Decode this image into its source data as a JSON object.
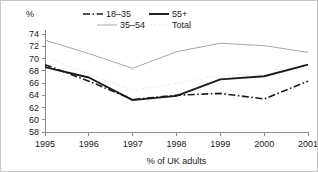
{
  "chart_data": {
    "type": "line",
    "title": "",
    "xlabel": "% of UK adults",
    "ylabel": "%",
    "yunit_label": "%",
    "categories": [
      "1995",
      "1996",
      "1997",
      "1998",
      "1999",
      "2000",
      "2001"
    ],
    "x": [
      1995,
      1996,
      1997,
      1998,
      1999,
      2000,
      2001
    ],
    "ylim": [
      58,
      74
    ],
    "xlim": [
      1995,
      2001
    ],
    "ytick_labels": [
      "58",
      "60",
      "62",
      "64",
      "66",
      "68",
      "70",
      "72",
      "74"
    ],
    "yticks": [
      58,
      60,
      62,
      64,
      66,
      68,
      70,
      72,
      74
    ],
    "grid": false,
    "legend_position": "top-center",
    "series": [
      {
        "name": "18–35",
        "values": [
          69.0,
          66.3,
          63.3,
          64.0,
          64.3,
          63.4,
          66.3
        ],
        "style": "dashdot",
        "color": "#1a1a1a",
        "width": 1.6,
        "dasharray": "7,2.5,1.6,2.5"
      },
      {
        "name": "55+",
        "values": [
          68.6,
          66.9,
          63.2,
          63.9,
          66.6,
          67.1,
          69.0
        ],
        "style": "solid",
        "color": "#1a1a1a",
        "width": 1.9,
        "dasharray": "none"
      },
      {
        "name": "35–54",
        "values": [
          73.0,
          70.8,
          68.4,
          71.1,
          72.5,
          72.1,
          71.0
        ],
        "style": "solid-light",
        "color": "#a6a6a6",
        "width": 1.0,
        "dasharray": "none"
      },
      {
        "name": "Total",
        "values": [
          70.3,
          67.5,
          64.8,
          65.9,
          67.3,
          67.4,
          68.5
        ],
        "style": "dotted",
        "color": "#1a1a1a",
        "width": 1.5,
        "dasharray": "0.1,2.4"
      }
    ],
    "legend_order": [
      "18–35",
      "55+",
      "35–54",
      "Total"
    ]
  }
}
